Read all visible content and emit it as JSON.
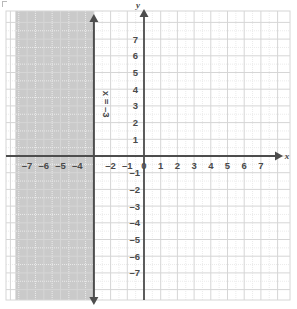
{
  "graph": {
    "title": "",
    "x_axis_name": "x",
    "y_axis_name": "y",
    "line_label": "x = –3",
    "x_tick_labels": [
      "–7",
      "–6",
      "–5",
      "–4",
      "–2",
      "–1",
      "0",
      "1",
      "2",
      "3",
      "4",
      "5",
      "6",
      "7"
    ],
    "y_tick_labels_positive": [
      "7",
      "6",
      "5",
      "4",
      "3",
      "2",
      "1"
    ],
    "y_tick_labels_negative": [
      "–1",
      "–2",
      "–3",
      "–4",
      "–5",
      "–6",
      "–7"
    ],
    "shade_color": "#cacaca",
    "axis_color": "#4d4d4d",
    "major_grid_color": "#d6d6d6",
    "minor_grid_color": "#ebebeb",
    "boundary_line_color": "#4d4d4d"
  },
  "chart_data": {
    "type": "line",
    "xlabel": "x",
    "ylabel": "y",
    "xlim": [
      -7.7,
      7.7
    ],
    "ylim": [
      -7.7,
      7.7
    ],
    "xticks": [
      -7,
      -6,
      -5,
      -4,
      -3,
      -2,
      -1,
      0,
      1,
      2,
      3,
      4,
      5,
      6,
      7
    ],
    "yticks": [
      -7,
      -6,
      -5,
      -4,
      -3,
      -2,
      -1,
      0,
      1,
      2,
      3,
      4,
      5,
      6,
      7
    ],
    "grid": true,
    "legend": "none",
    "series": [
      {
        "name": "x = –3",
        "type": "vertical-line",
        "x": -3,
        "style": "solid",
        "arrows": [
          "up",
          "down"
        ],
        "label": "x = –3"
      }
    ],
    "shaded_regions": [
      {
        "name": "x ≤ –3",
        "inequality": "x <= -3",
        "x_from": -7.7,
        "x_to": -3,
        "fill": "#cacaca"
      }
    ],
    "annotations": [
      {
        "text": "x = –3",
        "x": -3,
        "y": 4.5,
        "rotation": 90
      }
    ]
  }
}
